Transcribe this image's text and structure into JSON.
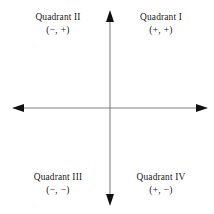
{
  "figure": {
    "type": "cartesian-quadrant-diagram",
    "width": 214,
    "height": 214,
    "background_color": "#ffffff",
    "axis_color": "#808080",
    "arrow_color": "#111111",
    "text_color": "#1a1a1a",
    "origin": {
      "x": 110,
      "y": 108
    },
    "x_axis": {
      "start_x": 14,
      "end_x": 206,
      "y": 108
    },
    "y_axis": {
      "x": 110,
      "start_y": 12,
      "end_y": 204
    }
  },
  "quadrants": [
    {
      "id": "quadrant-1",
      "name": "Quadrant I",
      "signs": "(+, +)"
    },
    {
      "id": "quadrant-2",
      "name": "Quadrant II",
      "signs": "(−, +)"
    },
    {
      "id": "quadrant-3",
      "name": "Quadrant III",
      "signs": "(−, −)"
    },
    {
      "id": "quadrant-4",
      "name": "Quadrant IV",
      "signs": "(+, −)"
    }
  ]
}
